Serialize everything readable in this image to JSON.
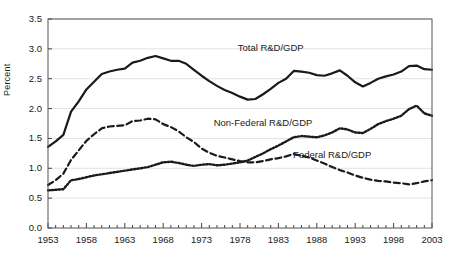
{
  "chart_data": {
    "type": "line",
    "title": "",
    "xlabel": "",
    "ylabel": "Percent",
    "xlim": [
      1953,
      2003
    ],
    "ylim": [
      0.0,
      3.5
    ],
    "grid": true,
    "legend_position": "inline-annotations",
    "ytick_labels": [
      "0.0",
      "0.5",
      "1.0",
      "1.5",
      "2.0",
      "2.5",
      "3.0",
      "3.5"
    ],
    "ytick_values": [
      0.0,
      0.5,
      1.0,
      1.5,
      2.0,
      2.5,
      3.0,
      3.5
    ],
    "xtick_labels": [
      "1953",
      "1958",
      "1963",
      "1968",
      "1973",
      "1978",
      "1983",
      "1988",
      "1993",
      "1998",
      "2003"
    ],
    "xtick_values": [
      1953,
      1958,
      1963,
      1968,
      1973,
      1978,
      1983,
      1988,
      1993,
      1998,
      2003
    ],
    "x": [
      1953,
      1954,
      1955,
      1956,
      1957,
      1958,
      1959,
      1960,
      1961,
      1962,
      1963,
      1964,
      1965,
      1966,
      1967,
      1968,
      1969,
      1970,
      1971,
      1972,
      1973,
      1974,
      1975,
      1976,
      1977,
      1978,
      1979,
      1980,
      1981,
      1982,
      1983,
      1984,
      1985,
      1986,
      1987,
      1988,
      1989,
      1990,
      1991,
      1992,
      1993,
      1994,
      1995,
      1996,
      1997,
      1998,
      1999,
      2000,
      2001,
      2002,
      2003
    ],
    "series": [
      {
        "name": "Total R&D/GDP",
        "style": "solid",
        "color": "#1a1a1a",
        "label_x": 1982,
        "label_y": 3.02,
        "values": [
          1.36,
          1.45,
          1.56,
          1.95,
          2.12,
          2.32,
          2.45,
          2.58,
          2.62,
          2.65,
          2.67,
          2.77,
          2.8,
          2.85,
          2.88,
          2.84,
          2.8,
          2.8,
          2.75,
          2.65,
          2.55,
          2.46,
          2.38,
          2.31,
          2.26,
          2.2,
          2.15,
          2.16,
          2.24,
          2.33,
          2.43,
          2.5,
          2.63,
          2.62,
          2.6,
          2.56,
          2.55,
          2.59,
          2.64,
          2.55,
          2.44,
          2.37,
          2.43,
          2.5,
          2.54,
          2.57,
          2.62,
          2.71,
          2.72,
          2.66,
          2.65
        ]
      },
      {
        "name": "Non-Federal R&D/GDP",
        "style": "dotted",
        "color": "#1a1a1a",
        "label_x": 1981,
        "label_y": 1.76,
        "values": [
          0.63,
          0.64,
          0.65,
          0.8,
          0.82,
          0.85,
          0.88,
          0.9,
          0.92,
          0.94,
          0.96,
          0.98,
          1.0,
          1.02,
          1.06,
          1.1,
          1.11,
          1.09,
          1.06,
          1.04,
          1.06,
          1.07,
          1.05,
          1.06,
          1.08,
          1.1,
          1.13,
          1.19,
          1.25,
          1.32,
          1.38,
          1.45,
          1.52,
          1.54,
          1.53,
          1.52,
          1.55,
          1.6,
          1.67,
          1.65,
          1.6,
          1.59,
          1.66,
          1.74,
          1.79,
          1.83,
          1.88,
          1.99,
          2.05,
          1.92,
          1.88
        ]
      },
      {
        "name": "Federal R&D/GDP",
        "style": "dashed",
        "color": "#1a1a1a",
        "label_x": 1990,
        "label_y": 1.22,
        "values": [
          0.72,
          0.8,
          0.91,
          1.14,
          1.3,
          1.46,
          1.57,
          1.67,
          1.7,
          1.71,
          1.72,
          1.79,
          1.8,
          1.83,
          1.82,
          1.74,
          1.69,
          1.62,
          1.52,
          1.44,
          1.33,
          1.26,
          1.21,
          1.18,
          1.15,
          1.12,
          1.1,
          1.1,
          1.12,
          1.15,
          1.17,
          1.2,
          1.24,
          1.21,
          1.18,
          1.13,
          1.08,
          1.02,
          0.97,
          0.93,
          0.88,
          0.84,
          0.81,
          0.79,
          0.78,
          0.76,
          0.75,
          0.73,
          0.75,
          0.78,
          0.8
        ]
      }
    ]
  }
}
